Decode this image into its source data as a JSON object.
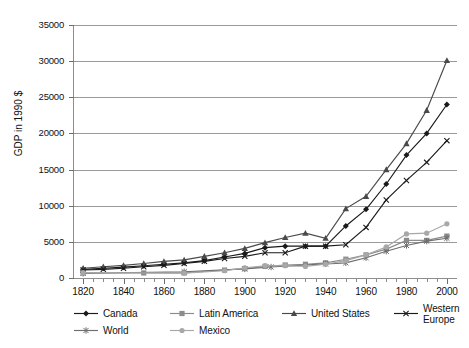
{
  "chart_data": {
    "type": "line",
    "title": "",
    "xlabel": "",
    "ylabel": "GDP in 1990 $",
    "xlim": [
      1815,
      2005
    ],
    "ylim": [
      0,
      35000
    ],
    "grid": true,
    "legend_position": "bottom",
    "ytick_labels": [
      "0",
      "5000",
      "10000",
      "15000",
      "20000",
      "25000",
      "30000",
      "35000"
    ],
    "ytick_values": [
      0,
      5000,
      10000,
      15000,
      20000,
      25000,
      30000,
      35000
    ],
    "xtick_labels": [
      "1820",
      "1840",
      "1860",
      "1880",
      "1900",
      "1920",
      "1940",
      "1960",
      "1980",
      "2000"
    ],
    "xtick_values": [
      1820,
      1840,
      1860,
      1880,
      1900,
      1920,
      1940,
      1960,
      1980,
      2000
    ],
    "x": [
      1820,
      1830,
      1840,
      1850,
      1860,
      1870,
      1880,
      1890,
      1900,
      1910,
      1920,
      1930,
      1940,
      1950,
      1960,
      1970,
      1980,
      1990,
      2000
    ],
    "series": [
      {
        "name": "Canada",
        "marker": "diamond",
        "color": "#1a1a1a",
        "x": [
          1820,
          1830,
          1840,
          1850,
          1860,
          1870,
          1880,
          1890,
          1900,
          1910,
          1920,
          1930,
          1940,
          1950,
          1960,
          1970,
          1980,
          1990,
          2000
        ],
        "values": [
          1200,
          1350,
          1500,
          1700,
          1900,
          2100,
          2400,
          2900,
          3400,
          4200,
          4400,
          4400,
          4400,
          7200,
          9500,
          13000,
          17000,
          20000,
          24000
        ]
      },
      {
        "name": "Latin America",
        "marker": "square",
        "color": "#8c8c8c",
        "x": [
          1820,
          1850,
          1870,
          1890,
          1900,
          1910,
          1920,
          1930,
          1940,
          1950,
          1960,
          1970,
          1980,
          1990,
          2000
        ],
        "values": [
          700,
          700,
          700,
          1100,
          1300,
          1600,
          1800,
          1900,
          2100,
          2600,
          3200,
          4000,
          5200,
          5200,
          5800
        ]
      },
      {
        "name": "United States",
        "marker": "triangle",
        "color": "#4a4a4a",
        "x": [
          1820,
          1830,
          1840,
          1850,
          1860,
          1870,
          1880,
          1890,
          1900,
          1910,
          1920,
          1930,
          1940,
          1950,
          1960,
          1970,
          1980,
          1990,
          2000
        ],
        "values": [
          1350,
          1550,
          1750,
          2000,
          2300,
          2500,
          3000,
          3500,
          4100,
          4900,
          5600,
          6200,
          5500,
          9600,
          11300,
          15000,
          18600,
          23200,
          30100
        ]
      },
      {
        "name": "Western Europe",
        "marker": "x",
        "color": "#1a1a1a",
        "x": [
          1820,
          1830,
          1840,
          1850,
          1860,
          1870,
          1880,
          1890,
          1900,
          1910,
          1920,
          1930,
          1940,
          1950,
          1960,
          1970,
          1980,
          1990,
          2000
        ],
        "values": [
          1100,
          1200,
          1350,
          1550,
          1750,
          2000,
          2300,
          2700,
          3000,
          3500,
          3500,
          4400,
          4400,
          4600,
          7000,
          10800,
          13500,
          16000,
          19000
        ]
      },
      {
        "name": "World",
        "marker": "asterisk",
        "color": "#6e6e6e",
        "x": [
          1820,
          1870,
          1900,
          1913,
          1940,
          1950,
          1960,
          1970,
          1980,
          1990,
          2000
        ],
        "values": [
          650,
          870,
          1260,
          1520,
          1950,
          2100,
          2800,
          3700,
          4500,
          5100,
          5500
        ]
      },
      {
        "name": "Mexico",
        "marker": "circle",
        "color": "#a8a8a8",
        "x": [
          1820,
          1870,
          1890,
          1900,
          1910,
          1920,
          1930,
          1940,
          1950,
          1960,
          1970,
          1980,
          1990,
          2000
        ],
        "values": [
          760,
          680,
          1000,
          1400,
          1700,
          1700,
          1600,
          1900,
          2400,
          3200,
          4300,
          6100,
          6200,
          7500
        ]
      }
    ],
    "legend_entries": [
      {
        "label": "Canada",
        "marker": "diamond",
        "color": "#1a1a1a"
      },
      {
        "label": "Latin America",
        "marker": "square",
        "color": "#8c8c8c"
      },
      {
        "label": "United States",
        "marker": "triangle",
        "color": "#4a4a4a"
      },
      {
        "label": "Western Europe",
        "marker": "x",
        "color": "#1a1a1a"
      },
      {
        "label": "World",
        "marker": "asterisk",
        "color": "#6e6e6e"
      },
      {
        "label": "Mexico",
        "marker": "circle",
        "color": "#a8a8a8"
      }
    ]
  },
  "colors": {
    "background": "#ffffff",
    "axis": "#8d8d8d",
    "grid": "#9a9a9a",
    "text": "#111111"
  }
}
